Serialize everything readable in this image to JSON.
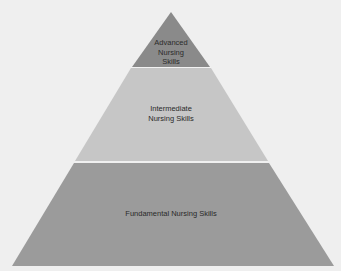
{
  "diagram": {
    "type": "pyramid",
    "tiers": [
      {
        "label": "Advanced\nNursing\nSkills",
        "lines": [
          "Advanced",
          "Nursing",
          "Skills"
        ],
        "color": "#8c8c8c"
      },
      {
        "label": "Intermediate\nNursing Skills",
        "lines": [
          "Intermediate",
          "Nursing Skills"
        ],
        "color": "#c4c4c4"
      },
      {
        "label": "Fundamental Nursing Skills",
        "lines": [
          "Fundamental Nursing Skills"
        ],
        "color": "#9a9a9a"
      }
    ],
    "separator_color": "#f2f2f2",
    "background": "#efefef"
  }
}
